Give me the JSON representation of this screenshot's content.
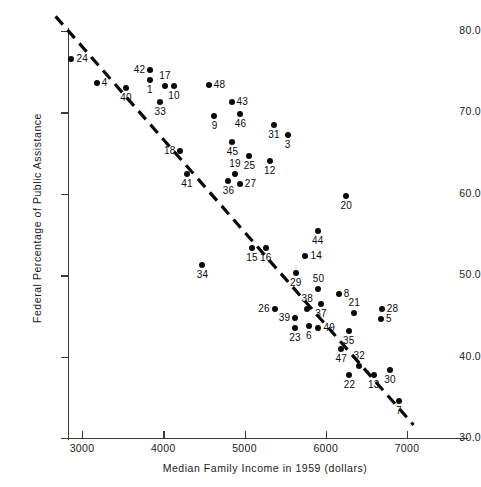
{
  "chart_data": {
    "type": "scatter",
    "title": "",
    "xlabel": "Median Family Income in 1959 (dollars)",
    "ylabel": "Federal Percentage of Public Assistance",
    "xlim": [
      2650,
      7650
    ],
    "ylim": [
      30.0,
      82.0
    ],
    "xticks": [
      3000,
      4000,
      5000,
      6000,
      7000
    ],
    "xtick_labels": [
      "3000",
      "4000",
      "5000",
      "6000",
      "7000"
    ],
    "yticks": [
      30.0,
      40.0,
      50.0,
      60.0,
      70.0,
      80.0
    ],
    "ytick_labels": [
      "30.0",
      "40.0",
      "50.0",
      "60.0",
      "70.0",
      "80.0"
    ],
    "grid": false,
    "legend": null,
    "marker_color": "#0a0a0a",
    "trend_line": {
      "style": "dashed",
      "color": "#0a0a0a",
      "x_start": 2675,
      "y_start": 81.8,
      "x_end": 7080,
      "y_end": 31.6
    },
    "points": [
      {
        "label": "24",
        "x": 2870,
        "y": 76.5,
        "label_pos": "right"
      },
      {
        "label": "4",
        "x": 3180,
        "y": 73.6,
        "label_pos": "right"
      },
      {
        "label": "40",
        "x": 3540,
        "y": 73.0,
        "label_pos": "below"
      },
      {
        "label": "42",
        "x": 3835,
        "y": 75.2,
        "label_pos": "left"
      },
      {
        "label": "1",
        "x": 3835,
        "y": 74.0,
        "label_pos": "below"
      },
      {
        "label": "17",
        "x": 4020,
        "y": 73.3,
        "label_pos": "above"
      },
      {
        "label": "10",
        "x": 4130,
        "y": 73.3,
        "label_pos": "below"
      },
      {
        "label": "33",
        "x": 3960,
        "y": 71.3,
        "label_pos": "below"
      },
      {
        "label": "48",
        "x": 4560,
        "y": 73.4,
        "label_pos": "right"
      },
      {
        "label": "43",
        "x": 4840,
        "y": 71.3,
        "label_pos": "right"
      },
      {
        "label": "9",
        "x": 4630,
        "y": 69.6,
        "label_pos": "below"
      },
      {
        "label": "46",
        "x": 4950,
        "y": 69.8,
        "label_pos": "below"
      },
      {
        "label": "31",
        "x": 5360,
        "y": 68.4,
        "label_pos": "below"
      },
      {
        "label": "3",
        "x": 5530,
        "y": 67.2,
        "label_pos": "below"
      },
      {
        "label": "45",
        "x": 4850,
        "y": 66.4,
        "label_pos": "below"
      },
      {
        "label": "18",
        "x": 4210,
        "y": 65.3,
        "label_pos": "left"
      },
      {
        "label": "25",
        "x": 5060,
        "y": 64.6,
        "label_pos": "below"
      },
      {
        "label": "12",
        "x": 5310,
        "y": 64.0,
        "label_pos": "below"
      },
      {
        "label": "19",
        "x": 4880,
        "y": 62.4,
        "label_pos": "above"
      },
      {
        "label": "41",
        "x": 4290,
        "y": 62.4,
        "label_pos": "below"
      },
      {
        "label": "36",
        "x": 4800,
        "y": 61.6,
        "label_pos": "below"
      },
      {
        "label": "27",
        "x": 4940,
        "y": 61.2,
        "label_pos": "right"
      },
      {
        "label": "20",
        "x": 6250,
        "y": 59.7,
        "label_pos": "below"
      },
      {
        "label": "44",
        "x": 5900,
        "y": 55.4,
        "label_pos": "below"
      },
      {
        "label": "15",
        "x": 5090,
        "y": 53.4,
        "label_pos": "below"
      },
      {
        "label": "16",
        "x": 5260,
        "y": 53.4,
        "label_pos": "below"
      },
      {
        "label": "14",
        "x": 5750,
        "y": 52.3,
        "label_pos": "right"
      },
      {
        "label": "34",
        "x": 4480,
        "y": 51.3,
        "label_pos": "below"
      },
      {
        "label": "29",
        "x": 5630,
        "y": 50.3,
        "label_pos": "below"
      },
      {
        "label": "50",
        "x": 5910,
        "y": 48.3,
        "label_pos": "above"
      },
      {
        "label": "8",
        "x": 6160,
        "y": 47.7,
        "label_pos": "right"
      },
      {
        "label": "26",
        "x": 5370,
        "y": 45.8,
        "label_pos": "left"
      },
      {
        "label": "37",
        "x": 5940,
        "y": 46.5,
        "label_pos": "below"
      },
      {
        "label": "38",
        "x": 5770,
        "y": 45.8,
        "label_pos": "above"
      },
      {
        "label": "39",
        "x": 5620,
        "y": 44.8,
        "label_pos": "left"
      },
      {
        "label": "21",
        "x": 6350,
        "y": 45.4,
        "label_pos": "above"
      },
      {
        "label": "28",
        "x": 6690,
        "y": 45.8,
        "label_pos": "right"
      },
      {
        "label": "5",
        "x": 6680,
        "y": 44.6,
        "label_pos": "right"
      },
      {
        "label": "23",
        "x": 5620,
        "y": 43.5,
        "label_pos": "below"
      },
      {
        "label": "6",
        "x": 5790,
        "y": 43.7,
        "label_pos": "below"
      },
      {
        "label": "49",
        "x": 5910,
        "y": 43.5,
        "label_pos": "right"
      },
      {
        "label": "35",
        "x": 6280,
        "y": 43.2,
        "label_pos": "below"
      },
      {
        "label": "47",
        "x": 6190,
        "y": 40.9,
        "label_pos": "below"
      },
      {
        "label": "32",
        "x": 6410,
        "y": 38.8,
        "label_pos": "above"
      },
      {
        "label": "22",
        "x": 6290,
        "y": 37.7,
        "label_pos": "below"
      },
      {
        "label": "13",
        "x": 6590,
        "y": 37.7,
        "label_pos": "below"
      },
      {
        "label": "30",
        "x": 6790,
        "y": 38.4,
        "label_pos": "below"
      },
      {
        "label": "7",
        "x": 6900,
        "y": 34.6,
        "label_pos": "below"
      }
    ]
  }
}
